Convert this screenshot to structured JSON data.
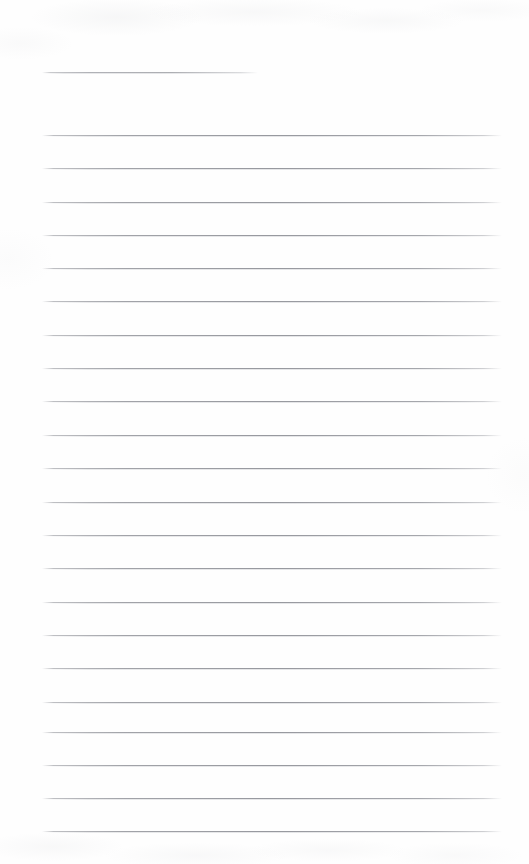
{
  "document": {
    "kind": "scanned-ruled-notebook-page",
    "title": "Blank ruled notepad page",
    "page_width": 529,
    "page_height": 864,
    "background_color": "#fefefe",
    "rule_color": "#8a8c93",
    "content_text": "",
    "visible_text": [],
    "margins": {
      "left": 42,
      "right": 27
    },
    "ruling": {
      "line_spacing": 33.4,
      "full_line_start_x": 42,
      "full_line_end_x": 502,
      "count": 24
    },
    "lines": [
      {
        "id": "rule-1",
        "x": 42,
        "y": 72,
        "width": 216,
        "variant": "short"
      },
      {
        "id": "rule-2",
        "x": 42,
        "y": 135,
        "width": 460,
        "variant": "full"
      },
      {
        "id": "rule-3",
        "x": 42,
        "y": 168,
        "width": 460,
        "variant": "full"
      },
      {
        "id": "rule-4",
        "x": 42,
        "y": 202,
        "width": 460,
        "variant": "full"
      },
      {
        "id": "rule-5",
        "x": 42,
        "y": 235,
        "width": 460,
        "variant": "full"
      },
      {
        "id": "rule-6",
        "x": 42,
        "y": 268,
        "width": 460,
        "variant": "full"
      },
      {
        "id": "rule-7",
        "x": 42,
        "y": 301,
        "width": 460,
        "variant": "full"
      },
      {
        "id": "rule-8",
        "x": 42,
        "y": 335,
        "width": 460,
        "variant": "full"
      },
      {
        "id": "rule-9",
        "x": 42,
        "y": 368,
        "width": 460,
        "variant": "full"
      },
      {
        "id": "rule-10",
        "x": 42,
        "y": 401,
        "width": 460,
        "variant": "full"
      },
      {
        "id": "rule-11",
        "x": 42,
        "y": 435,
        "width": 460,
        "variant": "full"
      },
      {
        "id": "rule-12",
        "x": 42,
        "y": 468,
        "width": 460,
        "variant": "full"
      },
      {
        "id": "rule-13",
        "x": 42,
        "y": 502,
        "width": 460,
        "variant": "full"
      },
      {
        "id": "rule-14",
        "x": 42,
        "y": 535,
        "width": 460,
        "variant": "full"
      },
      {
        "id": "rule-15",
        "x": 42,
        "y": 568,
        "width": 460,
        "variant": "full"
      },
      {
        "id": "rule-16",
        "x": 42,
        "y": 602,
        "width": 460,
        "variant": "full"
      },
      {
        "id": "rule-17",
        "x": 42,
        "y": 635,
        "width": 460,
        "variant": "full"
      },
      {
        "id": "rule-18",
        "x": 42,
        "y": 668,
        "width": 460,
        "variant": "full"
      },
      {
        "id": "rule-19",
        "x": 42,
        "y": 702,
        "width": 460,
        "variant": "full"
      },
      {
        "id": "rule-20",
        "x": 42,
        "y": 732,
        "width": 460,
        "variant": "full"
      },
      {
        "id": "rule-21",
        "x": 42,
        "y": 765,
        "width": 460,
        "variant": "full"
      },
      {
        "id": "rule-22",
        "x": 42,
        "y": 798,
        "width": 460,
        "variant": "full"
      },
      {
        "id": "rule-23",
        "x": 42,
        "y": 831,
        "width": 460,
        "variant": "full"
      }
    ]
  }
}
